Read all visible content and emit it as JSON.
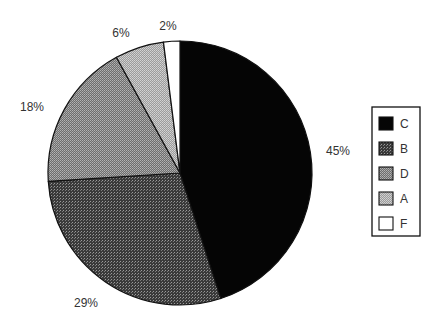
{
  "chart_data": {
    "type": "pie",
    "title": "",
    "start_angle_deg": 0,
    "direction": "clockwise",
    "slices": [
      {
        "label": "C",
        "value": 45,
        "display": "45%",
        "fill": "solid-black",
        "color": "#000000"
      },
      {
        "label": "B",
        "value": 29,
        "display": "29%",
        "fill": "dense-dark-pattern",
        "color": "#555555"
      },
      {
        "label": "D",
        "value": 18,
        "display": "18%",
        "fill": "medium-gray-pattern",
        "color": "#888888"
      },
      {
        "label": "A",
        "value": 6,
        "display": "6%",
        "fill": "light-gray-pattern",
        "color": "#aaaaaa"
      },
      {
        "label": "F",
        "value": 2,
        "display": "2%",
        "fill": "white",
        "color": "#ffffff"
      }
    ],
    "legend": {
      "position": "right",
      "entries": [
        "C",
        "B",
        "D",
        "A",
        "F"
      ]
    }
  }
}
